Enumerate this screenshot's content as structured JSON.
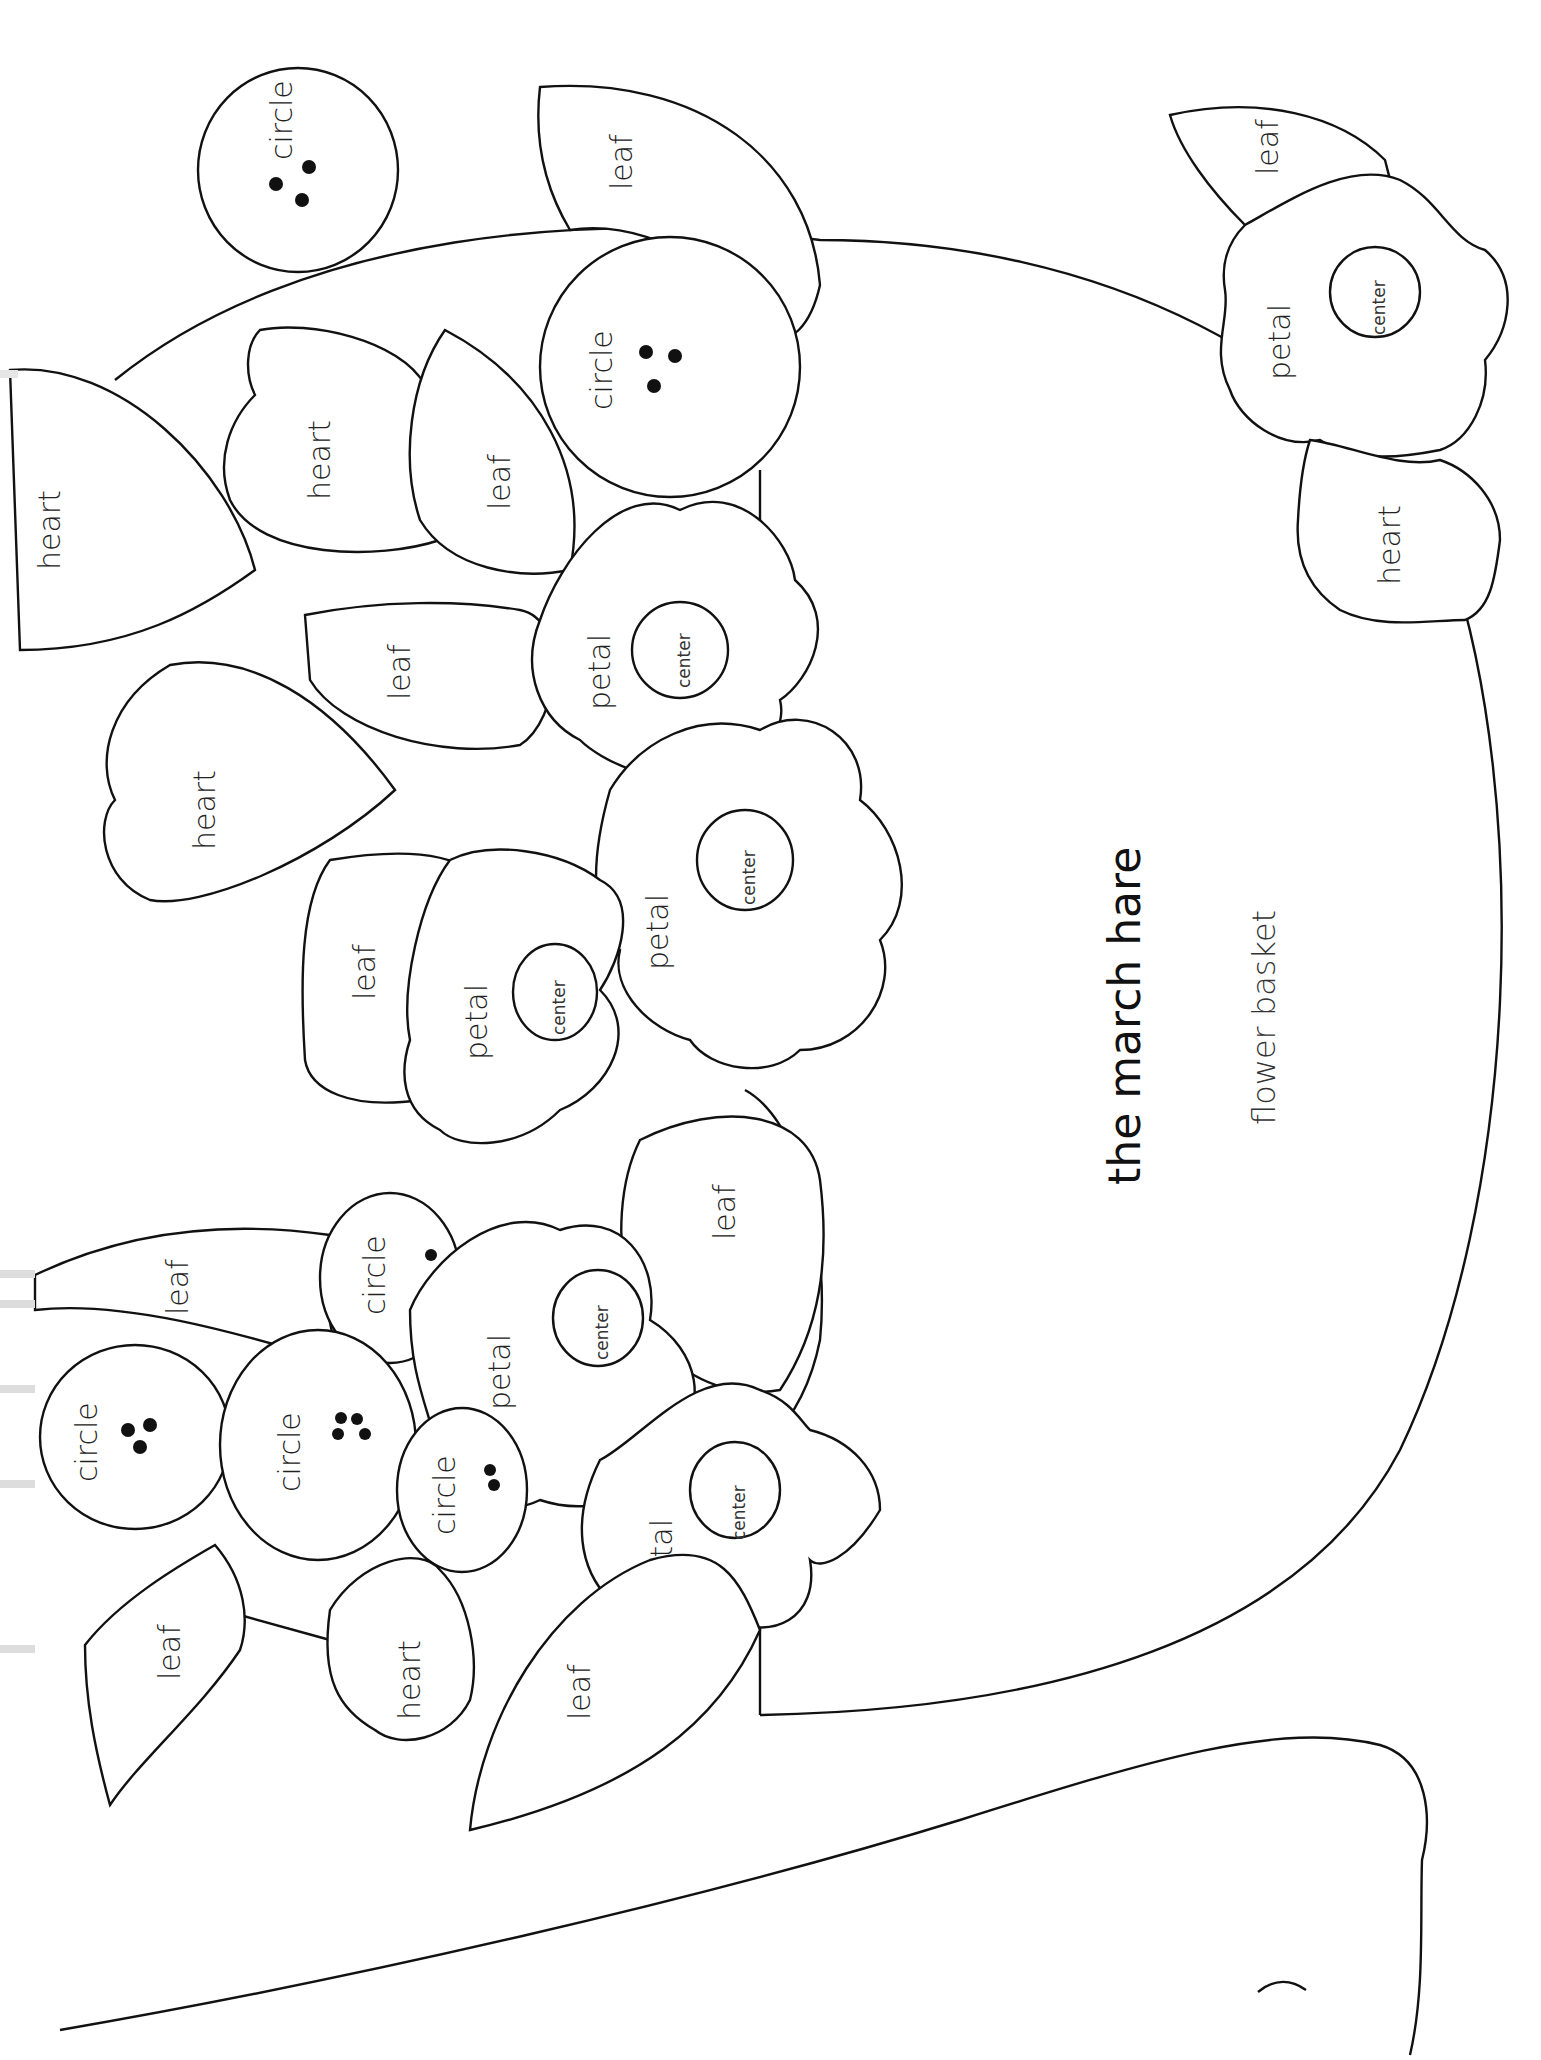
{
  "pattern": {
    "title": "the march hare",
    "subtitle": "flower basket",
    "orientation": "rotated-90-ccw",
    "stroke_color": "#111111",
    "background_color": "#ffffff"
  },
  "labels": {
    "circle": "circle",
    "leaf": "leaf",
    "heart": "heart",
    "petal": "petal",
    "center": "center"
  },
  "shapes": [
    {
      "type": "circle",
      "label": "circle",
      "dots": 3
    },
    {
      "type": "leaf",
      "label": "leaf"
    },
    {
      "type": "circle",
      "label": "circle",
      "dots": 3
    },
    {
      "type": "heart",
      "label": "heart"
    },
    {
      "type": "leaf",
      "label": "leaf"
    },
    {
      "type": "heart",
      "label": "heart"
    },
    {
      "type": "leaf",
      "label": "leaf"
    },
    {
      "type": "flower",
      "petal": "petal",
      "center": "center"
    },
    {
      "type": "heart",
      "label": "heart"
    },
    {
      "type": "leaf",
      "label": "leaf"
    },
    {
      "type": "flower",
      "petal": "petal",
      "center": "center"
    },
    {
      "type": "flower",
      "petal": "petal",
      "center": "center"
    },
    {
      "type": "leaf",
      "label": "leaf"
    },
    {
      "type": "leaf",
      "label": "leaf"
    },
    {
      "type": "circle",
      "label": "circle",
      "dots": 1
    },
    {
      "type": "flower",
      "petal": "petal",
      "center": "center"
    },
    {
      "type": "circle",
      "label": "circle",
      "dots": 3
    },
    {
      "type": "circle",
      "label": "circle",
      "dots": 4
    },
    {
      "type": "circle",
      "label": "circle",
      "dots": 2
    },
    {
      "type": "leaf",
      "label": "leaf"
    },
    {
      "type": "heart",
      "label": "heart"
    },
    {
      "type": "flower",
      "petal": "petal",
      "center": "center"
    },
    {
      "type": "leaf",
      "label": "leaf"
    },
    {
      "type": "leaf",
      "label": "leaf"
    },
    {
      "type": "flower",
      "petal": "petal",
      "center": "center"
    },
    {
      "type": "heart",
      "label": "heart"
    }
  ]
}
